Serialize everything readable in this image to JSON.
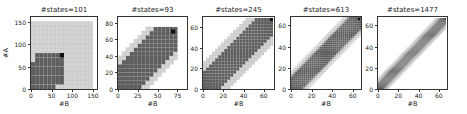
{
  "chart_data": [
    {
      "type": "heatmap",
      "title": "#states=101",
      "xlabel": "#B",
      "ylabel": "#A",
      "xlim": [
        0,
        160
      ],
      "ylim": [
        0,
        160
      ],
      "xticks": [
        0,
        50,
        100,
        150
      ],
      "yticks": [
        0,
        50,
        100,
        150
      ],
      "grid_step": 10,
      "description": "Light gray grid over nearly whole area; dark region from (0,0) to ~(80,80) with black cell at ~(70,70)",
      "dark_region": {
        "shape": "square",
        "extent": [
          0,
          80
        ]
      },
      "highlight_cell": [
        70,
        70
      ]
    },
    {
      "type": "heatmap",
      "title": "#states=93",
      "xlabel": "#B",
      "ylabel": "",
      "xlim": [
        0,
        87
      ],
      "ylim": [
        0,
        87
      ],
      "xticks": [
        0,
        25,
        50,
        75
      ],
      "yticks": [
        0,
        20,
        40,
        60,
        80
      ],
      "grid_step": 5,
      "description": "Diagonal band; dark core with light gray border, black cell near (70,70)",
      "band_halfwidth_dark": 30,
      "band_halfwidth_light": 40,
      "highlight_cell": [
        67,
        67
      ]
    },
    {
      "type": "heatmap",
      "title": "#states=245",
      "xlabel": "#B",
      "ylabel": "",
      "xlim": [
        0,
        70
      ],
      "ylim": [
        0,
        70
      ],
      "xticks": [
        0,
        20,
        40,
        60
      ],
      "yticks": [
        0,
        20,
        40,
        60
      ],
      "grid_step": 3,
      "description": "Diagonal band narrower; dark core with light border, black cell at top right",
      "band_halfwidth_dark": 17,
      "band_halfwidth_light": 25,
      "highlight_cell": [
        66,
        66
      ]
    },
    {
      "type": "heatmap",
      "title": "#states=613",
      "xlabel": "#B",
      "ylabel": "",
      "xlim": [
        0,
        68
      ],
      "ylim": [
        0,
        68
      ],
      "xticks": [
        0,
        20,
        40,
        60
      ],
      "yticks": [
        0,
        20,
        40,
        60
      ],
      "grid_step": 2,
      "description": "Diagonal band; dark core with gradient light border",
      "band_halfwidth_dark": 11,
      "band_halfwidth_light": 17,
      "highlight_cell": [
        65,
        65
      ]
    },
    {
      "type": "heatmap",
      "title": "#states=1477",
      "xlabel": "#B",
      "ylabel": "",
      "xlim": [
        0,
        68
      ],
      "ylim": [
        0,
        68
      ],
      "xticks": [
        0,
        20,
        40,
        60
      ],
      "yticks": [
        0,
        20,
        40,
        60
      ],
      "grid_step": 1,
      "description": "Narrow diagonal band; dark core with gradient border",
      "band_halfwidth_dark": 6,
      "band_halfwidth_light": 11,
      "highlight_cell": [
        66,
        66
      ]
    }
  ],
  "colors": {
    "dark": "#5e5e5e",
    "light": "#d4d4d4",
    "mid": "#a8a8a8",
    "highlight": "#111111",
    "grid": "#bdbdbd",
    "background": "#ffffff"
  },
  "layout": [
    {
      "left": 30,
      "top": 16,
      "width": 68,
      "height": 74
    },
    {
      "left": 117,
      "top": 16,
      "width": 71,
      "height": 74
    },
    {
      "left": 202,
      "top": 16,
      "width": 73,
      "height": 74
    },
    {
      "left": 290,
      "top": 16,
      "width": 72,
      "height": 74
    },
    {
      "left": 377,
      "top": 16,
      "width": 71,
      "height": 74
    }
  ]
}
